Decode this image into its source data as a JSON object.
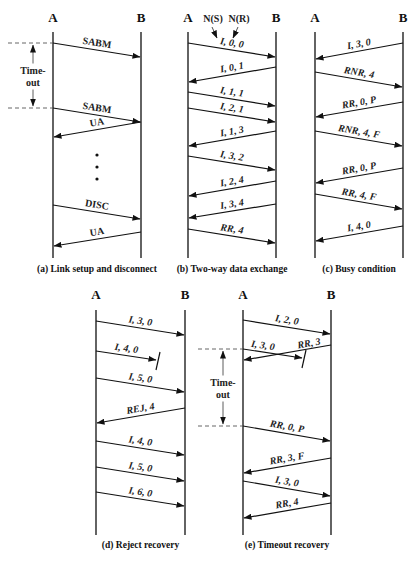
{
  "panels": [
    {
      "id": "a",
      "caption": "(a) Link setup and disconnect",
      "nodeA": "A",
      "nodeB": "B",
      "xA": 53,
      "xB": 141,
      "timeout": {
        "label1": "Time-",
        "label2": "out",
        "y1": 43,
        "y2": 108,
        "xLeft": 18
      },
      "arrows": [
        {
          "dir": "AB",
          "y1": 43,
          "y2": 57,
          "label": "SABM"
        },
        {
          "dir": "AB",
          "y1": 108,
          "y2": 122,
          "label": "SABM"
        },
        {
          "dir": "BA",
          "y1": 122,
          "y2": 137,
          "label": "UA"
        },
        {
          "dir": "AB",
          "y1": 205,
          "y2": 219,
          "label": "DISC"
        },
        {
          "dir": "BA",
          "y1": 232,
          "y2": 246,
          "label": "UA"
        }
      ],
      "dots_y": [
        155,
        167,
        179
      ]
    },
    {
      "id": "b",
      "caption": "(b) Two-way data exchange",
      "nodeA": "A",
      "nodeB": "B",
      "xA": 188,
      "xB": 276,
      "annotations": [
        "N(S)",
        "N(R)"
      ],
      "arrows": [
        {
          "dir": "AB",
          "y1": 43,
          "y2": 57,
          "label": "I, 0, 0"
        },
        {
          "dir": "BA",
          "y1": 67,
          "y2": 82,
          "label": "I, 0, 1"
        },
        {
          "dir": "AB",
          "y1": 92,
          "y2": 106,
          "label": "I, 1, 1"
        },
        {
          "dir": "AB",
          "y1": 108,
          "y2": 122,
          "label": "I, 2, 1"
        },
        {
          "dir": "BA",
          "y1": 131,
          "y2": 146,
          "label": "I, 1, 3"
        },
        {
          "dir": "AB",
          "y1": 156,
          "y2": 170,
          "label": "I, 3, 2"
        },
        {
          "dir": "BA",
          "y1": 181,
          "y2": 196,
          "label": "I, 2, 4"
        },
        {
          "dir": "BA",
          "y1": 204,
          "y2": 218,
          "label": "I, 3, 4"
        },
        {
          "dir": "AB",
          "y1": 229,
          "y2": 243,
          "label": "RR, 4"
        }
      ]
    },
    {
      "id": "c",
      "caption": "(c) Busy condition",
      "nodeA": "A",
      "nodeB": "B",
      "xA": 315,
      "xB": 403,
      "arrows": [
        {
          "dir": "BA",
          "y1": 43,
          "y2": 59,
          "label": "I, 3, 0"
        },
        {
          "dir": "AB",
          "y1": 72,
          "y2": 87,
          "label": "RNR, 4"
        },
        {
          "dir": "BA",
          "y1": 102,
          "y2": 117,
          "label": "RR, 0, P"
        },
        {
          "dir": "AB",
          "y1": 131,
          "y2": 146,
          "label": "RNR, 4, F"
        },
        {
          "dir": "BA",
          "y1": 168,
          "y2": 183,
          "label": "RR, 0, P"
        },
        {
          "dir": "AB",
          "y1": 194,
          "y2": 209,
          "label": "RR, 4, F"
        },
        {
          "dir": "BA",
          "y1": 226,
          "y2": 241,
          "label": "I, 4, 0"
        }
      ]
    },
    {
      "id": "d",
      "caption": "(d) Reject recovery",
      "nodeA": "A",
      "nodeB": "B",
      "xA": 96,
      "xB": 185,
      "arrows": [
        {
          "dir": "AB",
          "y1": 321,
          "y2": 335,
          "label": "I, 3, 0"
        },
        {
          "dir": "AB",
          "y1": 351,
          "y2": 360,
          "label": "I, 4, 0",
          "lost": true,
          "xEnd": 156
        },
        {
          "dir": "AB",
          "y1": 378,
          "y2": 392,
          "label": "I, 5, 0"
        },
        {
          "dir": "BA",
          "y1": 408,
          "y2": 423,
          "label": "REJ, 4"
        },
        {
          "dir": "AB",
          "y1": 441,
          "y2": 455,
          "label": "I, 4, 0"
        },
        {
          "dir": "AB",
          "y1": 467,
          "y2": 481,
          "label": "I, 5, 0"
        },
        {
          "dir": "AB",
          "y1": 492,
          "y2": 506,
          "label": "I, 6, 0"
        }
      ]
    },
    {
      "id": "e",
      "caption": "(e) Timeout recovery",
      "nodeA": "A",
      "nodeB": "B",
      "xA": 243,
      "xB": 331,
      "timeout": {
        "label1": "Time-",
        "label2": "out",
        "y1": 349,
        "y2": 426,
        "xLeft": 208
      },
      "arrows": [
        {
          "dir": "AB",
          "y1": 320,
          "y2": 334,
          "label": "I, 2, 0"
        },
        {
          "dir": "AB",
          "y1": 349,
          "y2": 358,
          "label": "I, 3, 0",
          "lost": true,
          "xEnd": 302
        },
        {
          "dir": "BA",
          "y1": 345,
          "y2": 360,
          "label": "RR, 3"
        },
        {
          "dir": "AB",
          "y1": 426,
          "y2": 441,
          "label": "RR, 0, P"
        },
        {
          "dir": "BA",
          "y1": 458,
          "y2": 473,
          "label": "RR, 3, F"
        },
        {
          "dir": "AB",
          "y1": 481,
          "y2": 496,
          "label": "I, 3, 0"
        },
        {
          "dir": "BA",
          "y1": 503,
          "y2": 518,
          "label": "RR, 4"
        }
      ]
    }
  ],
  "layout": {
    "top_row": {
      "node_y": 22,
      "line_top": 32,
      "line_bottom": 258,
      "caption_y": 272
    },
    "bottom_row": {
      "node_y": 299,
      "line_top": 310,
      "line_bottom": 535,
      "caption_y": 548
    }
  }
}
